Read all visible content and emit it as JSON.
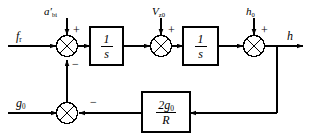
{
  "figure": {
    "header_ghost_text": "",
    "background_color": "#ffffff",
    "line_color": "#000000"
  },
  "inputs": [
    {
      "id": "f-input",
      "label": "f",
      "subscript": "r",
      "position": "left-top"
    },
    {
      "id": "g-input",
      "label": "g",
      "subscript": "0",
      "position": "left-bottom"
    },
    {
      "id": "a-input",
      "label": "a",
      "subscript": "bi",
      "prime": "′",
      "position": "top-1"
    },
    {
      "id": "v-input",
      "label": "V",
      "subscript": "z0",
      "position": "top-2"
    },
    {
      "id": "h-input",
      "label": "h",
      "subscript": "0",
      "position": "top-3"
    }
  ],
  "outputs": [
    {
      "id": "h-output",
      "label": "h",
      "position": "right"
    }
  ],
  "blocks": [
    {
      "id": "integrator-1",
      "numerator": "1",
      "denominator": "s"
    },
    {
      "id": "integrator-2",
      "numerator": "1",
      "denominator": "s"
    },
    {
      "id": "feedback-gain",
      "numerator": "2g",
      "numerator_subscript": "0",
      "denominator": "R"
    }
  ],
  "summing_junctions": [
    {
      "id": "sum-1",
      "signs": [
        {
          "position": "top-right",
          "symbol": "+"
        },
        {
          "position": "bottom",
          "symbol": "−"
        }
      ]
    },
    {
      "id": "sum-2",
      "signs": [
        {
          "position": "top-right",
          "symbol": "+"
        }
      ]
    },
    {
      "id": "sum-3",
      "signs": [
        {
          "position": "top-right",
          "symbol": "+"
        }
      ]
    },
    {
      "id": "sum-4",
      "signs": [
        {
          "position": "right",
          "symbol": "−"
        }
      ]
    }
  ]
}
